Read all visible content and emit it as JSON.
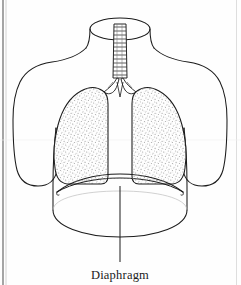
{
  "figure": {
    "title": "Diaphragm",
    "style": "line-drawing-stipple",
    "background_color": "#fefefe",
    "ink_color": "#1b1b1b",
    "stipple_color": "#8d8d8d",
    "width": 241,
    "height": 285
  },
  "labels": [
    {
      "id": "diaphragm",
      "text": "Diaphragm",
      "x": 120,
      "y": 277,
      "leader_from_x": 120,
      "leader_from_y": 186,
      "leader_to_x": 120,
      "leader_to_y": 262
    }
  ],
  "parts": {
    "neck": "neck-cylinder",
    "trachea": "trachea-with-cartilage-rings",
    "bronchi": "bronchial-bifurcation",
    "left_lung": "left-lung-stippled",
    "right_lung": "right-lung-stippled",
    "diaphragm": "diaphragm-dome",
    "torso": "torso-outline",
    "left_arm": "left-arm-stump",
    "right_arm": "right-arm-stump"
  },
  "artifacts": {
    "left_scan_edge": "page-edge-line",
    "right_scan_edge": "page-edge-line-faint"
  }
}
